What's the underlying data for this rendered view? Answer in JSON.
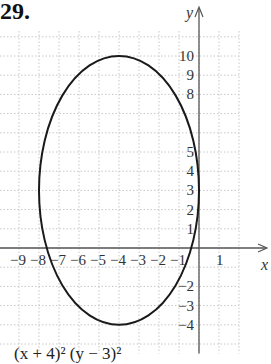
{
  "problem_number": "29.",
  "caption": "(x + 4)²         (y − 3)²",
  "chart_data": {
    "type": "line",
    "title": "",
    "xlabel": "x",
    "ylabel": "y",
    "xlim": [
      -10,
      2
    ],
    "ylim": [
      -5,
      12
    ],
    "grid": true,
    "x_ticks": [
      -9,
      -8,
      -7,
      -6,
      -5,
      -4,
      -3,
      -2,
      -1,
      1
    ],
    "y_ticks": [
      10,
      9,
      8,
      5,
      4,
      3,
      2,
      1,
      -2,
      -3,
      -4
    ],
    "series": [
      {
        "name": "ellipse",
        "shape": "ellipse",
        "center": [
          -4,
          3
        ],
        "semi_x": 4,
        "semi_y": 7
      }
    ]
  },
  "colors": {
    "curve": "#1a1a1a",
    "axis": "#555555",
    "grid": "#c8c8c8",
    "text": "#333333"
  }
}
